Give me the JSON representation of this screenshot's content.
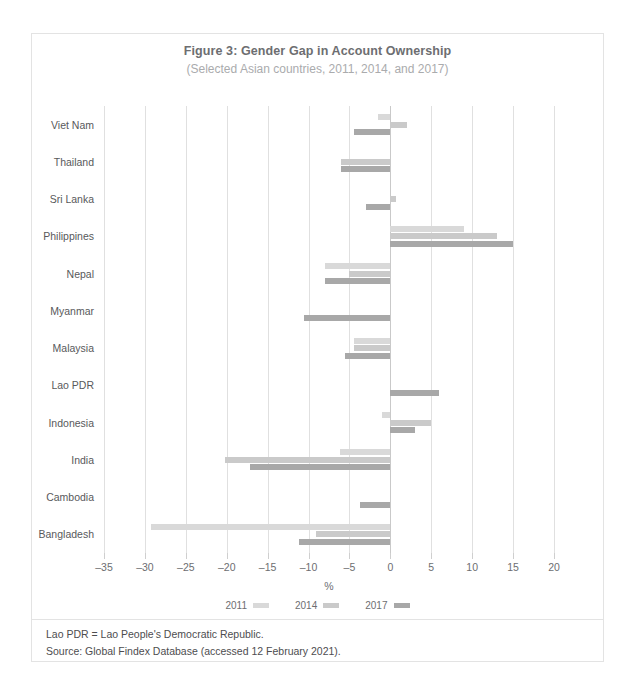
{
  "figure": {
    "title": "Figure 3: Gender Gap in Account Ownership",
    "subtitle": "(Selected Asian countries, 2011, 2014, and 2017)"
  },
  "notes": {
    "abbreviation": "Lao PDR = Lao People's Democratic Republic.",
    "source": "Source: Global Findex Database (accessed 12 February 2021)."
  },
  "colors": {
    "y2011": "#d9d9d9",
    "y2014": "#cacaca",
    "y2017": "#a8a8a8",
    "grid": "#e0e0e0",
    "zero_axis": "#c9c9c9",
    "title": "#6d6e71",
    "subtitle": "#aaabad",
    "border": "#e3e3e3"
  },
  "chart_data": {
    "type": "bar",
    "orientation": "horizontal",
    "title": "Figure 3: Gender Gap in Account Ownership",
    "subtitle": "(Selected Asian countries, 2011, 2014, and 2017)",
    "xlabel": "%",
    "ylabel": "",
    "xlim": [
      -35,
      20
    ],
    "xticks": [
      -35,
      -30,
      -25,
      -20,
      -15,
      -10,
      -5,
      0,
      5,
      10,
      15,
      20
    ],
    "xtick_labels": [
      "–35",
      "–30",
      "–25",
      "–20",
      "–15",
      "–10",
      "–5",
      "0",
      "5",
      "10",
      "15",
      "20"
    ],
    "grid": true,
    "legend_position": "bottom",
    "categories": [
      "Viet Nam",
      "Thailand",
      "Sri Lanka",
      "Philippines",
      "Nepal",
      "Myanmar",
      "Malaysia",
      "Lao PDR",
      "Indonesia",
      "India",
      "Cambodia",
      "Bangladesh"
    ],
    "series": [
      {
        "name": "2011",
        "color": "#d9d9d9",
        "values": [
          -1.5,
          null,
          null,
          9.0,
          -8.0,
          null,
          -4.5,
          null,
          -1.0,
          -6.1,
          null,
          -29.2
        ]
      },
      {
        "name": "2014",
        "color": "#cacaca",
        "values": [
          2.0,
          -6.0,
          0.7,
          13.0,
          -5.0,
          null,
          -4.5,
          null,
          5.0,
          -20.2,
          null,
          -9.1
        ]
      },
      {
        "name": "2017",
        "color": "#a8a8a8",
        "values": [
          -4.5,
          -6.0,
          -3.0,
          15.0,
          -8.0,
          -10.5,
          -5.5,
          6.0,
          3.0,
          -17.1,
          -3.7,
          -11.2
        ]
      }
    ]
  }
}
